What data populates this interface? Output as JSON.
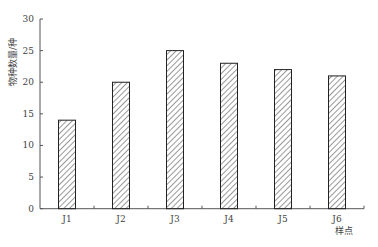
{
  "chart_data": {
    "type": "bar",
    "title": "",
    "xlabel": "样点",
    "ylabel": "物种数量/种",
    "categories": [
      "J1",
      "J2",
      "J3",
      "J4",
      "J5",
      "J6"
    ],
    "values": [
      14,
      20,
      25,
      23,
      22,
      21
    ],
    "ylim": [
      0,
      30
    ],
    "yticks": [
      0,
      5,
      10,
      15,
      20,
      25,
      30
    ],
    "grid": false,
    "legend": null,
    "bar_style": "diagonal hatch, black outline, white fill"
  },
  "colors": {
    "axis": "#555555",
    "bar_outline": "#222222",
    "hatch": "#333333",
    "background": "#ffffff"
  }
}
